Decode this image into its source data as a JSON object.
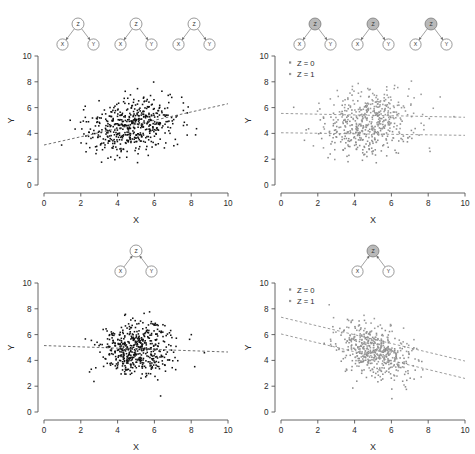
{
  "figure": {
    "caption_absent": true,
    "panel_count": 4,
    "background": "#ffffff"
  },
  "axes": {
    "xlabel": "X",
    "ylabel": "Y",
    "xticks": [
      "0",
      "2",
      "4",
      "6",
      "8",
      "10"
    ],
    "yticks": [
      "0",
      "2",
      "4",
      "6",
      "8",
      "10"
    ],
    "xlim": [
      0,
      10
    ],
    "ylim": [
      0,
      10
    ],
    "grid": false,
    "axis_color": "#555555",
    "tick_color": "#555555"
  },
  "legend": {
    "position": "top-left",
    "entries": [
      {
        "label": "Z = 0",
        "color": "#8c8c8c"
      },
      {
        "label": "Z = 1",
        "color": "#9a9a9a"
      }
    ]
  },
  "dag": {
    "node_labels": {
      "z": "Z",
      "x": "X",
      "y": "Y"
    },
    "node_fill_unshaded": "#ffffff",
    "node_fill_shaded": "#b9b9b9",
    "node_stroke": "#6e6e6e",
    "edge_color": "#6e6e6e"
  },
  "chart_data": [
    {
      "id": "panel-top-left",
      "type": "scatter",
      "title": "",
      "xlabel": "X",
      "ylabel": "Y",
      "xlim": [
        0,
        10
      ],
      "ylim": [
        0,
        10
      ],
      "grid": false,
      "point_color": "#111111",
      "dag": {
        "structure": "confounder",
        "description": "Z -> X and Z -> Y, unconditioned, repeated three times",
        "repeats": 3,
        "z_shaded": false,
        "edges": [
          {
            "from": "Z",
            "to": "X"
          },
          {
            "from": "Z",
            "to": "Y"
          }
        ]
      },
      "series": [
        {
          "name": "all",
          "n": 520,
          "color": "#111111",
          "mean_x": 4.75,
          "mean_y": 4.6,
          "sd_x": 1.25,
          "sd_y": 1.15,
          "correlation": 0.33
        }
      ],
      "fit_lines": [
        {
          "name": "pooled-regression",
          "style": "dashed",
          "color": "#555555",
          "x0": 0,
          "y0": 3.1,
          "x1": 10,
          "y1": 6.3,
          "slope": 0.32,
          "intercept": 3.1
        }
      ]
    },
    {
      "id": "panel-top-right",
      "type": "scatter",
      "title": "",
      "xlabel": "X",
      "ylabel": "Y",
      "xlim": [
        0,
        10
      ],
      "ylim": [
        0,
        10
      ],
      "grid": false,
      "dag": {
        "structure": "confounder-conditioned",
        "description": "Z -> X and Z -> Y with Z conditioned (shaded), repeated three times",
        "repeats": 3,
        "z_shaded": true,
        "edges": [
          {
            "from": "Z",
            "to": "X"
          },
          {
            "from": "Z",
            "to": "Y"
          }
        ]
      },
      "series": [
        {
          "name": "Z = 0",
          "n": 260,
          "color": "#8c8c8c",
          "mean_x": 4.4,
          "mean_y": 4.1,
          "sd_x": 1.15,
          "sd_y": 1.05,
          "correlation": 0.0
        },
        {
          "name": "Z = 1",
          "n": 260,
          "color": "#9a9a9a",
          "mean_x": 5.1,
          "mean_y": 5.4,
          "sd_x": 1.15,
          "sd_y": 1.05,
          "correlation": 0.0
        }
      ],
      "fit_lines": [
        {
          "name": "Z = 1 stratum regression",
          "style": "dashed",
          "color": "#8a8a8a",
          "x0": 0,
          "y0": 5.55,
          "x1": 10,
          "y1": 5.25,
          "slope": -0.03,
          "intercept": 5.55
        },
        {
          "name": "Z = 0 stratum regression",
          "style": "dashed",
          "color": "#8a8a8a",
          "x0": 0,
          "y0": 4.05,
          "x1": 10,
          "y1": 3.85,
          "slope": -0.02,
          "intercept": 4.05
        }
      ]
    },
    {
      "id": "panel-bottom-left",
      "type": "scatter",
      "title": "",
      "xlabel": "X",
      "ylabel": "Y",
      "xlim": [
        0,
        10
      ],
      "ylim": [
        0,
        10
      ],
      "grid": false,
      "point_color": "#111111",
      "dag": {
        "structure": "collider",
        "description": "X -> Z and Y -> Z, Z unconditioned",
        "repeats": 1,
        "z_shaded": false,
        "edges": [
          {
            "from": "X",
            "to": "Z"
          },
          {
            "from": "Y",
            "to": "Z"
          }
        ]
      },
      "series": [
        {
          "name": "all",
          "n": 520,
          "color": "#111111",
          "mean_x": 5.0,
          "mean_y": 4.85,
          "sd_x": 1.0,
          "sd_y": 1.0,
          "correlation": -0.03
        }
      ],
      "fit_lines": [
        {
          "name": "pooled-regression",
          "style": "dashed",
          "color": "#555555",
          "x0": 0,
          "y0": 5.15,
          "x1": 10,
          "y1": 4.65,
          "slope": -0.05,
          "intercept": 5.15
        }
      ]
    },
    {
      "id": "panel-bottom-right",
      "type": "scatter",
      "title": "",
      "xlabel": "X",
      "ylabel": "Y",
      "xlim": [
        0,
        10
      ],
      "ylim": [
        0,
        10
      ],
      "grid": false,
      "dag": {
        "structure": "collider-conditioned",
        "description": "X -> Z and Y -> Z with Z conditioned (shaded)",
        "repeats": 1,
        "z_shaded": true,
        "edges": [
          {
            "from": "X",
            "to": "Z"
          },
          {
            "from": "Y",
            "to": "Z"
          }
        ]
      },
      "series": [
        {
          "name": "Z = 0",
          "n": 260,
          "color": "#8c8c8c",
          "mean_x": 5.0,
          "mean_y": 4.6,
          "sd_x": 1.0,
          "sd_y": 1.05,
          "correlation": -0.35
        },
        {
          "name": "Z = 1",
          "n": 260,
          "color": "#9a9a9a",
          "mean_x": 5.1,
          "mean_y": 5.0,
          "sd_x": 1.0,
          "sd_y": 1.05,
          "correlation": -0.35
        }
      ],
      "fit_lines": [
        {
          "name": "Z = 1 stratum regression",
          "style": "dashed",
          "color": "#8a8a8a",
          "x0": 0,
          "y0": 7.35,
          "x1": 10,
          "y1": 3.95,
          "slope": -0.34,
          "intercept": 7.35
        },
        {
          "name": "Z = 0 stratum regression",
          "style": "dashed",
          "color": "#8a8a8a",
          "x0": 0,
          "y0": 6.05,
          "x1": 10,
          "y1": 2.6,
          "slope": -0.345,
          "intercept": 6.05
        }
      ]
    }
  ]
}
